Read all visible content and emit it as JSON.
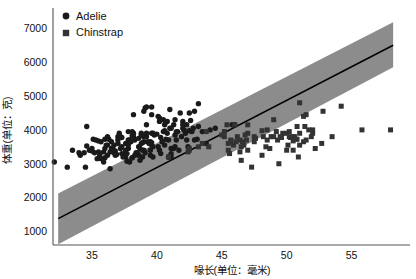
{
  "chart_data": {
    "type": "scatter",
    "title": "",
    "xlabel": "喙长(单位：毫米)",
    "ylabel": "体重(单位：克)",
    "xlim": [
      32,
      59.5
    ],
    "ylim": [
      600,
      7600
    ],
    "xticks": [
      35,
      40,
      45,
      50,
      55
    ],
    "xtick_labels": [
      "35",
      "40",
      "45",
      "50",
      "55"
    ],
    "yticks": [
      1000,
      2000,
      3000,
      4000,
      5000,
      6000,
      7000
    ],
    "ytick_labels": [
      "1000",
      "2000",
      "3000",
      "4000",
      "5000",
      "6000",
      "7000"
    ],
    "grid": false,
    "legend_position": "upper-left",
    "legend": [
      {
        "name": "Adelie",
        "marker": "circle",
        "color": "#1a1a1a"
      },
      {
        "name": "Chinstrap",
        "marker": "square",
        "color": "#333333"
      }
    ],
    "regression": {
      "name": "linear-fit-with-confidence-band",
      "line_color": "#000000",
      "band_color": "#808080",
      "band_opacity": 0.85,
      "x_start": 32.4,
      "x_end": 58.2,
      "y_at_x_start": 1380,
      "y_at_x_end": 6500,
      "band_lower_at_x_start": 620,
      "band_upper_at_x_start": 2120,
      "band_lower_at_x_end": 5850,
      "band_upper_at_x_end": 7180
    },
    "series": [
      {
        "name": "Adelie",
        "marker": "circle",
        "color": "#1a1a1a",
        "points": [
          [
            32.1,
            3050
          ],
          [
            33.1,
            2900
          ],
          [
            33.5,
            3400
          ],
          [
            34.0,
            3325
          ],
          [
            34.1,
            3250
          ],
          [
            34.4,
            3325
          ],
          [
            34.5,
            2900
          ],
          [
            34.6,
            4100
          ],
          [
            34.6,
            3525
          ],
          [
            35.0,
            3450
          ],
          [
            35.0,
            3375
          ],
          [
            35.1,
            3725
          ],
          [
            35.2,
            3325
          ],
          [
            35.3,
            3700
          ],
          [
            35.5,
            3350
          ],
          [
            35.5,
            3675
          ],
          [
            35.6,
            3250
          ],
          [
            35.7,
            3650
          ],
          [
            35.7,
            3150
          ],
          [
            35.9,
            3350
          ],
          [
            35.9,
            3050
          ],
          [
            36.0,
            3450
          ],
          [
            36.0,
            3725
          ],
          [
            36.2,
            3250
          ],
          [
            36.2,
            3800
          ],
          [
            36.2,
            3550
          ],
          [
            36.3,
            3725
          ],
          [
            36.4,
            3350
          ],
          [
            36.4,
            2850
          ],
          [
            36.5,
            3650
          ],
          [
            36.5,
            3450
          ],
          [
            36.6,
            3475
          ],
          [
            36.7,
            3325
          ],
          [
            36.7,
            3550
          ],
          [
            36.8,
            3375
          ],
          [
            36.9,
            3275
          ],
          [
            37.0,
            3600
          ],
          [
            37.0,
            3700
          ],
          [
            37.0,
            3800
          ],
          [
            37.2,
            3800
          ],
          [
            37.2,
            3450
          ],
          [
            37.3,
            3775
          ],
          [
            37.3,
            3500
          ],
          [
            37.3,
            3300
          ],
          [
            37.5,
            3300
          ],
          [
            37.6,
            3600
          ],
          [
            37.6,
            3400
          ],
          [
            37.6,
            3200
          ],
          [
            37.7,
            3600
          ],
          [
            37.7,
            3300
          ],
          [
            37.7,
            3075
          ],
          [
            37.8,
            3700
          ],
          [
            37.8,
            3450
          ],
          [
            37.8,
            3950
          ],
          [
            37.9,
            3050
          ],
          [
            37.9,
            3700
          ],
          [
            38.1,
            3175
          ],
          [
            38.1,
            3825
          ],
          [
            38.1,
            3950
          ],
          [
            38.2,
            3900
          ],
          [
            38.2,
            3800
          ],
          [
            38.3,
            3700
          ],
          [
            38.5,
            3300
          ],
          [
            38.5,
            3325
          ],
          [
            38.6,
            3250
          ],
          [
            38.6,
            3500
          ],
          [
            38.6,
            3750
          ],
          [
            38.7,
            3100
          ],
          [
            38.8,
            3850
          ],
          [
            38.8,
            3900
          ],
          [
            38.8,
            3600
          ],
          [
            38.9,
            3625
          ],
          [
            38.9,
            3200
          ],
          [
            39.0,
            3800
          ],
          [
            39.0,
            3400
          ],
          [
            39.0,
            3650
          ],
          [
            39.1,
            3325
          ],
          [
            39.2,
            4150
          ],
          [
            39.2,
            4675
          ],
          [
            39.2,
            3800
          ],
          [
            39.3,
            3650
          ],
          [
            39.5,
            3250
          ],
          [
            39.5,
            3400
          ],
          [
            39.5,
            3650
          ],
          [
            39.6,
            3550
          ],
          [
            39.6,
            3900
          ],
          [
            39.6,
            4450
          ],
          [
            39.6,
            3625
          ],
          [
            39.7,
            3200
          ],
          [
            39.7,
            3500
          ],
          [
            39.7,
            3900
          ],
          [
            39.8,
            3850
          ],
          [
            40.1,
            4400
          ],
          [
            40.2,
            4350
          ],
          [
            40.2,
            4250
          ],
          [
            40.2,
            3400
          ],
          [
            40.3,
            3300
          ],
          [
            40.5,
            4300
          ],
          [
            40.5,
            3950
          ],
          [
            40.6,
            3550
          ],
          [
            40.6,
            3950
          ],
          [
            40.6,
            4150
          ],
          [
            40.6,
            3975
          ],
          [
            40.7,
            3725
          ],
          [
            40.8,
            4250
          ],
          [
            40.8,
            3900
          ],
          [
            40.9,
            3200
          ],
          [
            40.9,
            3700
          ],
          [
            40.9,
            3200
          ],
          [
            41.0,
            4050
          ],
          [
            41.1,
            3200
          ],
          [
            41.1,
            4050
          ],
          [
            41.1,
            3300
          ],
          [
            41.1,
            3450
          ],
          [
            41.3,
            4150
          ],
          [
            41.3,
            3450
          ],
          [
            41.4,
            3500
          ],
          [
            41.4,
            4300
          ],
          [
            41.5,
            3700
          ],
          [
            41.5,
            3950
          ],
          [
            41.6,
            3950
          ],
          [
            41.8,
            4500
          ],
          [
            42.0,
            4150
          ],
          [
            42.0,
            4250
          ],
          [
            42.1,
            4000
          ],
          [
            42.2,
            3900
          ],
          [
            42.3,
            4150
          ],
          [
            42.3,
            3700
          ],
          [
            42.4,
            3500
          ],
          [
            42.5,
            4500
          ],
          [
            42.5,
            3975
          ],
          [
            42.7,
            3950
          ],
          [
            42.8,
            4050
          ],
          [
            42.9,
            3700
          ],
          [
            43.1,
            3725
          ],
          [
            43.2,
            4100
          ],
          [
            43.2,
            4775
          ],
          [
            44.1,
            4000
          ],
          [
            45.8,
            4150
          ],
          [
            46.0,
            4150
          ],
          [
            36.0,
            3175
          ],
          [
            37.8,
            3550
          ],
          [
            38.1,
            3175
          ],
          [
            38.9,
            3400
          ],
          [
            39.2,
            3900
          ],
          [
            39.6,
            4675
          ],
          [
            40.3,
            3775
          ],
          [
            41.0,
            4600
          ],
          [
            42.0,
            4050
          ],
          [
            42.9,
            4550
          ],
          [
            38.7,
            3450
          ],
          [
            39.1,
            4650
          ],
          [
            40.0,
            3875
          ],
          [
            40.7,
            4225
          ],
          [
            41.4,
            3850
          ],
          [
            36.8,
            3250
          ],
          [
            37.1,
            3900
          ],
          [
            38.0,
            3650
          ],
          [
            38.4,
            3325
          ],
          [
            40.4,
            3650
          ],
          [
            41.9,
            3800
          ],
          [
            43.5,
            3950
          ],
          [
            44.5,
            4050
          ],
          [
            38.2,
            4450
          ],
          [
            39.0,
            4550
          ],
          [
            37.4,
            3200
          ],
          [
            36.1,
            3550
          ],
          [
            34.8,
            3400
          ],
          [
            35.4,
            3150
          ],
          [
            43.8,
            3600
          ],
          [
            42.6,
            4275
          ],
          [
            41.7,
            3400
          ],
          [
            40.1,
            3500
          ],
          [
            39.4,
            3600
          ],
          [
            38.3,
            3250
          ]
        ]
      },
      {
        "name": "Chinstrap",
        "marker": "square",
        "color": "#333333",
        "points": [
          [
            40.9,
            3200
          ],
          [
            42.4,
            3350
          ],
          [
            42.5,
            3400
          ],
          [
            42.5,
            3450
          ],
          [
            43.2,
            3500
          ],
          [
            43.5,
            3600
          ],
          [
            45.2,
            3800
          ],
          [
            45.2,
            3950
          ],
          [
            45.4,
            4150
          ],
          [
            45.5,
            3600
          ],
          [
            45.5,
            3400
          ],
          [
            45.6,
            3300
          ],
          [
            45.7,
            3650
          ],
          [
            45.7,
            3700
          ],
          [
            45.9,
            3550
          ],
          [
            46.0,
            4150
          ],
          [
            46.1,
            3650
          ],
          [
            46.2,
            3800
          ],
          [
            46.4,
            3700
          ],
          [
            46.4,
            3350
          ],
          [
            46.5,
            3500
          ],
          [
            46.6,
            3650
          ],
          [
            46.7,
            3550
          ],
          [
            46.8,
            3850
          ],
          [
            46.9,
            3700
          ],
          [
            47.0,
            4150
          ],
          [
            47.0,
            3900
          ],
          [
            47.5,
            3650
          ],
          [
            47.5,
            3800
          ],
          [
            47.6,
            3750
          ],
          [
            48.1,
            3250
          ],
          [
            48.1,
            3975
          ],
          [
            48.2,
            3800
          ],
          [
            48.4,
            3500
          ],
          [
            48.5,
            4000
          ],
          [
            48.5,
            3700
          ],
          [
            48.7,
            3450
          ],
          [
            48.8,
            3800
          ],
          [
            49.0,
            3800
          ],
          [
            49.0,
            4300
          ],
          [
            49.2,
            3950
          ],
          [
            49.3,
            3700
          ],
          [
            49.5,
            3800
          ],
          [
            49.6,
            3775
          ],
          [
            49.7,
            3900
          ],
          [
            50.0,
            3900
          ],
          [
            50.1,
            3550
          ],
          [
            50.2,
            3800
          ],
          [
            50.2,
            3950
          ],
          [
            50.3,
            3775
          ],
          [
            50.5,
            3400
          ],
          [
            50.5,
            3800
          ],
          [
            50.5,
            3675
          ],
          [
            50.6,
            3800
          ],
          [
            50.7,
            3725
          ],
          [
            50.8,
            4100
          ],
          [
            50.8,
            3725
          ],
          [
            50.9,
            3200
          ],
          [
            51.0,
            3900
          ],
          [
            51.0,
            4800
          ],
          [
            51.3,
            4400
          ],
          [
            51.3,
            3650
          ],
          [
            51.4,
            4100
          ],
          [
            51.5,
            3700
          ],
          [
            51.5,
            4450
          ],
          [
            51.7,
            4000
          ],
          [
            51.9,
            3800
          ],
          [
            52.0,
            3900
          ],
          [
            52.0,
            4000
          ],
          [
            52.2,
            3450
          ],
          [
            52.7,
            3600
          ],
          [
            52.8,
            4550
          ],
          [
            53.5,
            3800
          ],
          [
            54.2,
            4700
          ],
          [
            55.8,
            4000
          ],
          [
            58.0,
            4000
          ],
          [
            47.0,
            3400
          ],
          [
            44.0,
            3500
          ],
          [
            46.5,
            3100
          ],
          [
            47.3,
            2900
          ],
          [
            49.4,
            3000
          ],
          [
            50.0,
            3400
          ],
          [
            51.0,
            3550
          ],
          [
            45.0,
            3850
          ],
          [
            43.8,
            3950
          ]
        ]
      }
    ]
  },
  "legend_items": {
    "adelie": "Adelie",
    "chinstrap": "Chinstrap"
  },
  "axis_titles": {
    "x": "喙长(单位：毫米)",
    "y": "体重(单位：克)"
  }
}
